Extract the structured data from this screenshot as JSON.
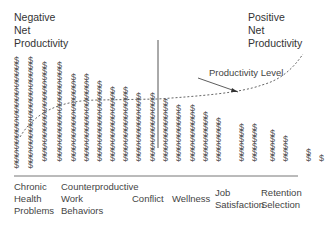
{
  "corner_labels": {
    "negative": "Negative\nNet\nProductivity",
    "positive": "Positive\nNet\nProductivity"
  },
  "curve_label": "Productivity Level",
  "dollar_symbol": "$",
  "chart_data": {
    "type": "bar",
    "title": "",
    "column_counts": [
      18,
      18,
      16,
      16,
      14,
      14,
      13,
      12,
      12,
      11,
      11,
      10,
      9,
      9,
      8,
      7,
      6,
      6,
      5,
      4,
      2,
      1
    ],
    "categories": [
      "Chronic\nHealth\nProblems",
      "Counterproductive\nWork\nBehaviors",
      "Conflict",
      "Wellness",
      "Job\nSatisfaction",
      "Retention\nSelection"
    ],
    "series": [
      {
        "name": "Productivity Level",
        "style": "dashed",
        "trend": "increasing"
      }
    ],
    "annotations": [
      "Productivity Level"
    ],
    "xlabel": "",
    "ylabel": "",
    "grid": false
  }
}
